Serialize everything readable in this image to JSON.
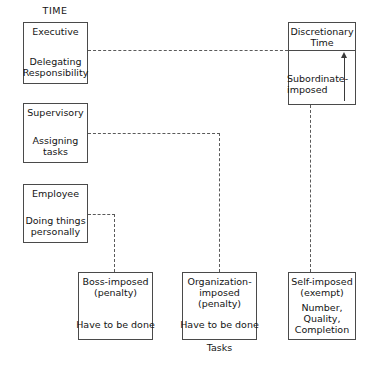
{
  "diagram": {
    "title_label": "TIME",
    "axis_label": "Tasks",
    "boxes": {
      "executive": {
        "heading": "Executive",
        "body": "Delegating\nResponsibility"
      },
      "supervisory": {
        "heading": "Supervisory",
        "body": "Assigning\ntasks"
      },
      "employee": {
        "heading": "Employee",
        "body": "Doing things\npersonally"
      },
      "discretionary": {
        "heading": "Discretionary\nTime",
        "body": "Subordinate-\nimposed"
      },
      "boss_imposed": {
        "heading": "Boss-imposed\n(penalty)",
        "body": "Have to be done"
      },
      "organization_imposed": {
        "heading": "Organization-\nimposed\n(penalty)",
        "body": "Have to be done"
      },
      "self_imposed": {
        "heading": "Self-imposed\n(exempt)",
        "body": "Number,\nQuality,\nCompletion"
      }
    },
    "colors": {
      "stroke": "#4a4a4a",
      "dash": "#5a5a5a",
      "text": "#141414",
      "background": "#ffffff"
    }
  }
}
